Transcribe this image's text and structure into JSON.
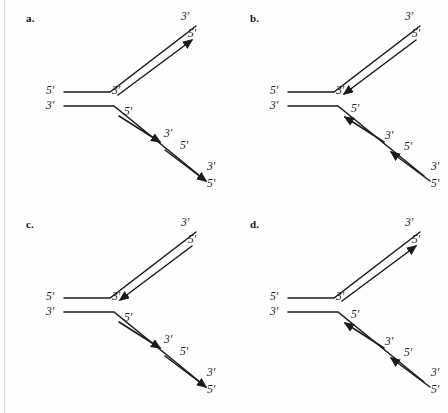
{
  "figure": {
    "background_color": "#fefefe",
    "ink_color": "#1a1a1a",
    "width": 448,
    "height": 413
  },
  "panels": [
    {
      "letter": "a.",
      "name": "panel-a",
      "top_branch": {
        "outer_label": "3'",
        "inner_label": "5'",
        "fork_label": "3'",
        "arrow_direction": "outward",
        "arrow_count": 1
      },
      "left_labels": {
        "upper": "5'",
        "lower": "3'"
      },
      "fork_lower_label": "5'",
      "bottom_branch": {
        "arrow_direction": "outward",
        "arrow_count": 2,
        "fragment1": {
          "start_label": "5'",
          "end_label": "3'"
        },
        "fragment2": {
          "start_label": "5'",
          "end_label": "3'"
        },
        "terminal_label": "5'"
      }
    },
    {
      "letter": "b.",
      "name": "panel-b",
      "top_branch": {
        "outer_label": "3'",
        "inner_label": "5'",
        "fork_label": "3'",
        "arrow_direction": "inward",
        "arrow_count": 1
      },
      "left_labels": {
        "upper": "5'",
        "lower": "3'"
      },
      "fork_lower_label": "5'",
      "bottom_branch": {
        "arrow_direction": "inward",
        "arrow_count": 2,
        "fragment1": {
          "start_label": "3'",
          "end_label": "5'"
        },
        "fragment2": {
          "start_label": "3'",
          "end_label": "5'"
        },
        "terminal_label": "5'"
      }
    },
    {
      "letter": "c.",
      "name": "panel-c",
      "top_branch": {
        "outer_label": "3'",
        "inner_label": "5'",
        "fork_label": "3'",
        "arrow_direction": "inward",
        "arrow_count": 1
      },
      "left_labels": {
        "upper": "5'",
        "lower": "3'"
      },
      "fork_lower_label": "5'",
      "bottom_branch": {
        "arrow_direction": "outward",
        "arrow_count": 2,
        "fragment1": {
          "start_label": "5'",
          "end_label": "3'"
        },
        "fragment2": {
          "start_label": "5'",
          "end_label": "3'"
        },
        "terminal_label": "5'"
      }
    },
    {
      "letter": "d.",
      "name": "panel-d",
      "top_branch": {
        "outer_label": "3'",
        "inner_label": "5'",
        "fork_label": "3'",
        "arrow_direction": "outward",
        "arrow_count": 1
      },
      "left_labels": {
        "upper": "5'",
        "lower": "3'"
      },
      "fork_lower_label": "5'",
      "bottom_branch": {
        "arrow_direction": "inward",
        "arrow_count": 2,
        "fragment1": {
          "start_label": "3'",
          "end_label": "5'"
        },
        "fragment2": {
          "start_label": "3'",
          "end_label": "5'"
        },
        "terminal_label": "5'"
      }
    }
  ]
}
